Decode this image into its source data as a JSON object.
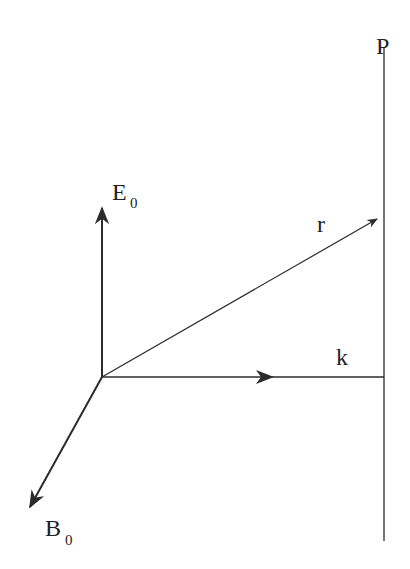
{
  "diagram": {
    "labels": {
      "plane": "P",
      "electric_field": "E",
      "electric_field_sub": "0",
      "magnetic_field": "B",
      "magnetic_field_sub": "0",
      "position_vector": "r",
      "wave_vector": "k"
    },
    "colors": {
      "line": "#2b2b2b",
      "background": "#ffffff"
    }
  }
}
